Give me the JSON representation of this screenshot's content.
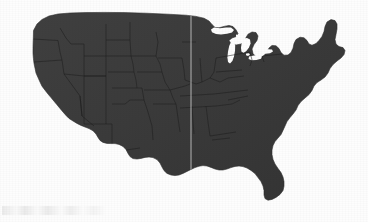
{
  "figure": {
    "kind": "map",
    "projection_look": "albers-like conic",
    "rendering": "solid silhouette with faint internal state boundaries",
    "background_color": "#fdfdfd",
    "land_fill_color": "#3b3b3b",
    "land_fill_color_dark": "#2e2e2e",
    "state_border_color": "#1e1e1e",
    "lake_fill_color": "#fdfdfd",
    "meridian_line_color": "#b8b8b8",
    "canvas": {
      "width": 368,
      "height": 222
    }
  },
  "map_extent": {
    "left_px": 33,
    "right_px": 345,
    "top_px": 12,
    "bottom_px": 201
  },
  "meridian_line": {
    "name": "vertical-reference-line",
    "x_px": 191,
    "y_start_px": 12,
    "y_end_px": 176,
    "width_px": 1,
    "color": "#bdbdbd"
  },
  "great_lakes": [
    {
      "name": "Lake Superior"
    },
    {
      "name": "Lake Michigan"
    },
    {
      "name": "Lake Huron"
    },
    {
      "name": "Lake Erie"
    },
    {
      "name": "Lake Ontario"
    }
  ],
  "regions": [
    {
      "name": "Pacific Northwest"
    },
    {
      "name": "California Coast"
    },
    {
      "name": "Mountain West"
    },
    {
      "name": "Great Plains"
    },
    {
      "name": "Midwest"
    },
    {
      "name": "Northeast / New England"
    },
    {
      "name": "Southeast"
    },
    {
      "name": "Gulf Coast"
    },
    {
      "name": "Florida Peninsula"
    },
    {
      "name": "Texas"
    }
  ],
  "artifacts": {
    "scan_smudge": {
      "name": "bottom-left-scan-smudge",
      "x_px": 2,
      "y_px": 206,
      "width_px": 104,
      "height_px": 9,
      "opacity": 0.12
    },
    "grain_overlay_opacity": 0.3
  }
}
